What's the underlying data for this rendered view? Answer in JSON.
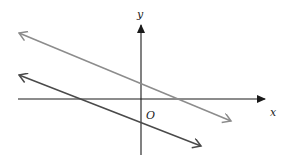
{
  "diagram": {
    "type": "coordinate-plane",
    "axes": {
      "x_label": "x",
      "y_label": "y",
      "origin_label": "O",
      "color": "#1a1a1a"
    },
    "lines": [
      {
        "name": "upper-line",
        "color": "#8c8c8c",
        "slope_sign": "negative",
        "crosses_y_axis": "positive",
        "crosses_x_axis": "positive",
        "arrows": "both"
      },
      {
        "name": "lower-line",
        "color": "#4a4a4a",
        "slope_sign": "negative",
        "crosses_y_axis": "negative",
        "crosses_x_axis": "negative",
        "arrows": "both"
      }
    ]
  }
}
